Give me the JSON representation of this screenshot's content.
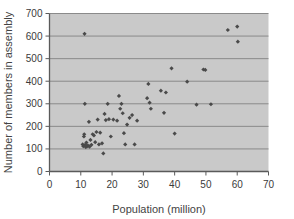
{
  "chart_data": {
    "type": "scatter",
    "title": "",
    "xlabel": "Population (million)",
    "ylabel": "Number of members in assembly",
    "xlim": [
      0,
      70
    ],
    "ylim": [
      0,
      700
    ],
    "xticks": [
      0,
      10,
      20,
      30,
      40,
      50,
      60,
      70
    ],
    "yticks": [
      0,
      100,
      200,
      300,
      400,
      500,
      600,
      700
    ],
    "grid": "horizontal",
    "legend": null,
    "plot_background": "#c9c9c9",
    "gridline_color": "#8a8a8a",
    "axis_color": "#5a5a5a",
    "marker_color": "#4a4a4a",
    "marker_shape": "diamond",
    "points": [
      {
        "x": 10.6,
        "y": 120
      },
      {
        "x": 10.8,
        "y": 112
      },
      {
        "x": 11.0,
        "y": 155
      },
      {
        "x": 11.1,
        "y": 165
      },
      {
        "x": 11.2,
        "y": 610
      },
      {
        "x": 11.3,
        "y": 300
      },
      {
        "x": 11.4,
        "y": 118
      },
      {
        "x": 11.6,
        "y": 108
      },
      {
        "x": 11.8,
        "y": 128
      },
      {
        "x": 12.0,
        "y": 112
      },
      {
        "x": 12.3,
        "y": 115
      },
      {
        "x": 12.6,
        "y": 220
      },
      {
        "x": 12.8,
        "y": 110
      },
      {
        "x": 13.1,
        "y": 140
      },
      {
        "x": 13.4,
        "y": 118
      },
      {
        "x": 13.8,
        "y": 165
      },
      {
        "x": 14.2,
        "y": 160
      },
      {
        "x": 14.6,
        "y": 130
      },
      {
        "x": 15.0,
        "y": 175
      },
      {
        "x": 15.4,
        "y": 230
      },
      {
        "x": 15.8,
        "y": 120
      },
      {
        "x": 16.2,
        "y": 172
      },
      {
        "x": 16.8,
        "y": 125
      },
      {
        "x": 17.2,
        "y": 80
      },
      {
        "x": 17.6,
        "y": 255
      },
      {
        "x": 18.0,
        "y": 228
      },
      {
        "x": 18.6,
        "y": 300
      },
      {
        "x": 19.0,
        "y": 232
      },
      {
        "x": 19.6,
        "y": 155
      },
      {
        "x": 20.4,
        "y": 230
      },
      {
        "x": 21.6,
        "y": 225
      },
      {
        "x": 22.2,
        "y": 335
      },
      {
        "x": 22.6,
        "y": 278
      },
      {
        "x": 23.0,
        "y": 300
      },
      {
        "x": 23.4,
        "y": 258
      },
      {
        "x": 23.8,
        "y": 170
      },
      {
        "x": 24.2,
        "y": 120
      },
      {
        "x": 24.8,
        "y": 208
      },
      {
        "x": 25.6,
        "y": 238
      },
      {
        "x": 26.4,
        "y": 250
      },
      {
        "x": 27.2,
        "y": 120
      },
      {
        "x": 28.0,
        "y": 225
      },
      {
        "x": 31.2,
        "y": 325
      },
      {
        "x": 31.6,
        "y": 388
      },
      {
        "x": 32.0,
        "y": 305
      },
      {
        "x": 32.4,
        "y": 278
      },
      {
        "x": 35.6,
        "y": 358
      },
      {
        "x": 36.6,
        "y": 260
      },
      {
        "x": 37.2,
        "y": 350
      },
      {
        "x": 39.0,
        "y": 457
      },
      {
        "x": 40.0,
        "y": 168
      },
      {
        "x": 44.0,
        "y": 398
      },
      {
        "x": 47.0,
        "y": 296
      },
      {
        "x": 49.2,
        "y": 452
      },
      {
        "x": 49.8,
        "y": 450
      },
      {
        "x": 51.6,
        "y": 298
      },
      {
        "x": 57.0,
        "y": 627
      },
      {
        "x": 60.0,
        "y": 642
      },
      {
        "x": 60.2,
        "y": 575
      }
    ]
  }
}
